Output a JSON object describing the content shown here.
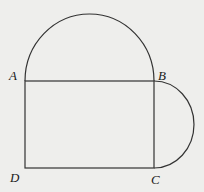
{
  "diagram": {
    "labels": {
      "A": "A",
      "B": "B",
      "C": "C",
      "D": "D"
    },
    "stroke_color": "#333333",
    "background_color": "#eeeeec"
  }
}
